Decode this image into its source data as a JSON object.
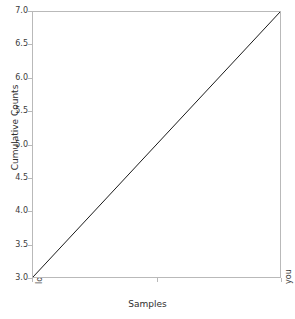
{
  "chart_data": {
    "type": "line",
    "title": "",
    "xlabel": "Samples",
    "ylabel": "Cumulative Counts",
    "categories": [
      "love",
      "you"
    ],
    "x": [
      0,
      1
    ],
    "values": [
      3.0,
      7.0
    ],
    "series": [
      {
        "name": "cumulative",
        "values": [
          3.0,
          7.0
        ]
      }
    ],
    "xlim": [
      0,
      1
    ],
    "ylim": [
      3.0,
      7.0
    ],
    "yticks": [
      "7.0",
      "6.5",
      "6.0",
      "5.5",
      "5.0",
      "4.5",
      "4.0",
      "3.5",
      "3.0"
    ],
    "ytick_values": [
      7.0,
      6.5,
      6.0,
      5.5,
      5.0,
      4.5,
      4.0,
      3.5,
      3.0
    ],
    "xticks": [
      "love",
      "you"
    ],
    "xtick_rotation": 90,
    "grid": false,
    "legend": null,
    "line_color": "#1a1a1a",
    "line_width": 1,
    "frame_color": "#b9b9b9",
    "background_color": "#ffffff",
    "text_color": "#3b3b3b"
  }
}
